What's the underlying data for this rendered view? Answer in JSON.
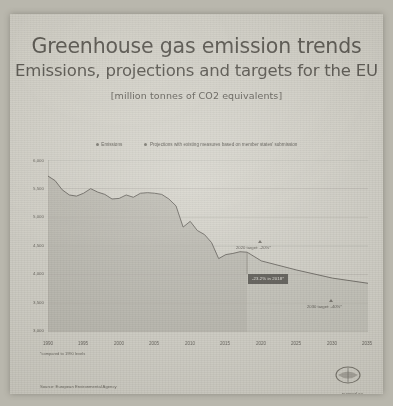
{
  "poster": {
    "title": "Greenhouse gas emission trends",
    "subtitle": "Emissions, projections and targets for the EU",
    "units": "[million tonnes of CO2 equivalents]",
    "footnote": "*compared to 1990 levels",
    "source": "Source: European Environmental Agency",
    "website": "europarl.eu",
    "logo_name": "eu-parliament-logo"
  },
  "chart_data": {
    "type": "area",
    "title": "Greenhouse gas emission trends",
    "subtitle": "Emissions, projections and targets for the EU",
    "ylabel": "[million tonnes of CO2 equivalents]",
    "xlabel": "",
    "xlim": [
      1990,
      2035
    ],
    "ylim": [
      3000,
      6000
    ],
    "grid": true,
    "legend_position": "top-center",
    "y_ticks": [
      "6,000",
      "5,500",
      "5,000",
      "4,500",
      "4,000",
      "3,500",
      "3,000"
    ],
    "y_tick_values": [
      6000,
      5500,
      5000,
      4500,
      4000,
      3500,
      3000
    ],
    "x_ticks": [
      "1990",
      "1995",
      "2000",
      "2005",
      "2010",
      "2015",
      "2020",
      "2025",
      "2030",
      "2035"
    ],
    "x_tick_values": [
      1990,
      1995,
      2000,
      2005,
      2010,
      2015,
      2020,
      2025,
      2030,
      2035
    ],
    "series": [
      {
        "name": "Emissions",
        "marker": "dot",
        "x": [
          1990,
          1991,
          1992,
          1993,
          1994,
          1995,
          1996,
          1997,
          1998,
          1999,
          2000,
          2001,
          2002,
          2003,
          2004,
          2005,
          2006,
          2007,
          2008,
          2009,
          2010,
          2011,
          2012,
          2013,
          2014,
          2015,
          2016,
          2017,
          2018
        ],
        "values": [
          5720,
          5640,
          5480,
          5390,
          5370,
          5420,
          5500,
          5440,
          5400,
          5320,
          5330,
          5390,
          5350,
          5420,
          5430,
          5420,
          5400,
          5320,
          5200,
          4830,
          4930,
          4770,
          4700,
          4560,
          4280,
          4350,
          4370,
          4400,
          4392
        ]
      },
      {
        "name": "Projections with existing measures based on member states' submission",
        "marker": "dot",
        "x": [
          2018,
          2020,
          2025,
          2030,
          2035
        ],
        "values": [
          4392,
          4240,
          4080,
          3940,
          3850
        ]
      }
    ],
    "annotations": [
      {
        "label": "2020 target: -20%*",
        "x": 2020,
        "y": 4240,
        "marker": "triangle"
      },
      {
        "label": "-23.2% in 2018*",
        "x": 2021,
        "y": 3980,
        "style": "dark-callout"
      },
      {
        "label": "2030 target: -40%*",
        "x": 2030,
        "y": 3430,
        "marker": "triangle"
      }
    ]
  }
}
